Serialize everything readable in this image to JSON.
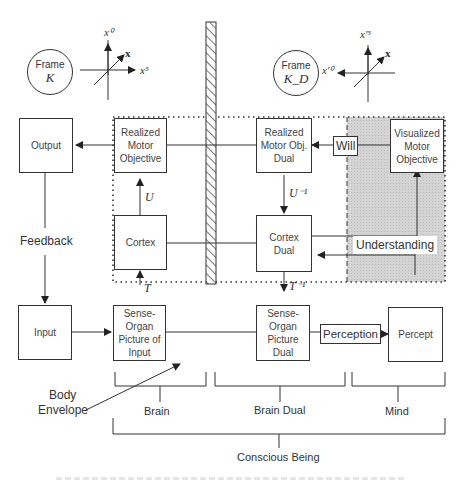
{
  "frames": {
    "left": {
      "line1": "Frame",
      "line2": "K",
      "axes": {
        "up": "x⁰",
        "right": "x⁵",
        "diag": "x"
      }
    },
    "right": {
      "line1": "Frame",
      "line2": "K_D",
      "axes": {
        "up": "x'⁵",
        "left": "x'⁰",
        "diag": "x"
      }
    }
  },
  "boxes": {
    "output": "Output",
    "input": "Input",
    "realized_motor_objective": "Realized Motor Objective",
    "cortex": "Cortex",
    "sense_organ_picture_of_input": "Sense- Organ Picture of Input",
    "realized_motor_obj_dual": "Realized Motor Obj. Dual",
    "cortex_dual": "Cortex Dual",
    "sense_organ_picture_dual": "Sense- Organ Picture Dual",
    "visualized_motor_objective": "Visualized Motor Objective",
    "percept": "Percept"
  },
  "edge_labels": {
    "feedback": "Feedback",
    "U": "U",
    "T": "T",
    "U_inv": "U⁻¹",
    "T_inv": "T⁻¹",
    "will": "Will",
    "understanding": "Understanding",
    "perception": "Perception"
  },
  "annotations": {
    "body_envelope_1": "Body",
    "body_envelope_2": "Envelope"
  },
  "groups": {
    "brain": "Brain",
    "brain_dual": "Brain Dual",
    "mind": "Mind",
    "conscious_being": "Conscious Being"
  },
  "colors": {
    "stroke": "#333333",
    "mind_shade": "#d9d9d9",
    "hatch": "#555555"
  }
}
